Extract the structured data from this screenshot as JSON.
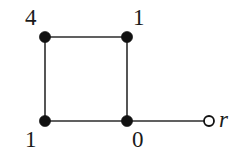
{
  "figure": {
    "background_color": "#ffffff",
    "edge_color": "#2b2b2b",
    "node_fill_color": "#111111",
    "node_stroke_color": "#111111",
    "root_node_fill": "#ffffff",
    "edge_width": 1.6,
    "filled_node_radius": 5.6,
    "open_node_radius": 5.0,
    "open_node_stroke_width": 1.8
  },
  "nodes": [
    {
      "id": "top-left",
      "label": "4",
      "x": 45,
      "y": 37,
      "style": "filled",
      "label_x": 25,
      "label_y": 6,
      "label_italic": false
    },
    {
      "id": "top-right",
      "label": "1",
      "x": 127,
      "y": 37,
      "style": "filled",
      "label_x": 133,
      "label_y": 6,
      "label_italic": false
    },
    {
      "id": "bottom-left",
      "label": "1",
      "x": 45,
      "y": 121,
      "style": "filled",
      "label_x": 25,
      "label_y": 128,
      "label_italic": false
    },
    {
      "id": "bottom-right",
      "label": "0",
      "x": 127,
      "y": 121,
      "style": "filled",
      "label_x": 132,
      "label_y": 128,
      "label_italic": false
    },
    {
      "id": "root",
      "label": "r",
      "x": 209,
      "y": 121,
      "style": "open",
      "label_x": 219,
      "label_y": 108,
      "label_italic": true
    }
  ],
  "edges": [
    {
      "id": "edge-top",
      "from": "top-left",
      "to": "top-right",
      "x1": 45,
      "y1": 37,
      "x2": 127,
      "y2": 37
    },
    {
      "id": "edge-left",
      "from": "top-left",
      "to": "bottom-left",
      "x1": 45,
      "y1": 37,
      "x2": 45,
      "y2": 121
    },
    {
      "id": "edge-right",
      "from": "top-right",
      "to": "bottom-right",
      "x1": 127,
      "y1": 37,
      "x2": 127,
      "y2": 121
    },
    {
      "id": "edge-bottom",
      "from": "bottom-left",
      "to": "bottom-right",
      "x1": 45,
      "y1": 121,
      "x2": 127,
      "y2": 121
    },
    {
      "id": "edge-root",
      "from": "bottom-right",
      "to": "root",
      "x1": 127,
      "y1": 121,
      "x2": 204,
      "y2": 121
    }
  ]
}
